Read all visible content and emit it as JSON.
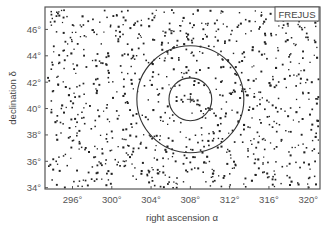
{
  "chart_data": {
    "type": "scatter",
    "title": "",
    "xlabel": "right ascension α",
    "ylabel": "declination δ",
    "xlim": [
      293.2,
      321.2
    ],
    "ylim": [
      33.9,
      47.7
    ],
    "x_ticks": [
      296,
      300,
      304,
      308,
      312,
      316,
      320
    ],
    "x_tick_labels": [
      "296°",
      "300°",
      "304°",
      "308°",
      "312°",
      "316°",
      "320°"
    ],
    "y_ticks": [
      34,
      36,
      38,
      40,
      42,
      44,
      46
    ],
    "y_tick_labels": [
      "34°",
      "36°",
      "38°",
      "40°",
      "42°",
      "44°",
      "46°"
    ],
    "x_reversed": false,
    "grid": false,
    "legend": {
      "entries": [
        "FREJUS"
      ],
      "position": "upper right"
    },
    "annotations": [
      {
        "type": "circle",
        "center_ra": 308.0,
        "center_dec": 40.7,
        "radius_deg": 5.0,
        "label": "outer circle"
      },
      {
        "type": "circle",
        "center_ra": 308.0,
        "center_dec": 40.7,
        "radius_deg": 2.0,
        "label": "inner circle"
      },
      {
        "type": "marker",
        "shape": "plus",
        "ra": 308.0,
        "dec": 40.7,
        "label": "source position"
      }
    ],
    "series": [
      {
        "name": "FREJUS events",
        "distribution": "approximately uniform over the plotted region",
        "approx_count": 950,
        "marker": "dot",
        "color": "#222222",
        "generator_seed": 20240517
      }
    ]
  },
  "colors": {
    "frame": "#555555",
    "points": "#222222",
    "circles": "#333333",
    "text": "#555555"
  }
}
